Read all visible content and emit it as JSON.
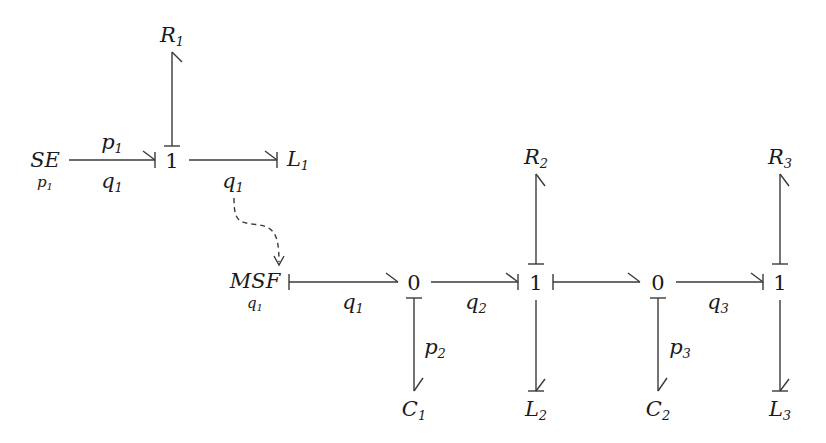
{
  "diagram": {
    "type": "bond-graph",
    "elements": {
      "SE": {
        "base": "SE",
        "sub": "",
        "under": {
          "base": "p",
          "sub": "1"
        }
      },
      "R1": {
        "base": "R",
        "sub": "1"
      },
      "J1a": {
        "base": "1"
      },
      "L1": {
        "base": "L",
        "sub": "1"
      },
      "MSF": {
        "base": "MSF",
        "sub": "",
        "under": {
          "base": "q",
          "sub": "1"
        }
      },
      "J0a": {
        "base": "0"
      },
      "C1": {
        "base": "C",
        "sub": "1"
      },
      "J1b": {
        "base": "1"
      },
      "R2": {
        "base": "R",
        "sub": "2"
      },
      "L2": {
        "base": "L",
        "sub": "2"
      },
      "J0b": {
        "base": "0"
      },
      "C2": {
        "base": "C",
        "sub": "2"
      },
      "J1c": {
        "base": "1"
      },
      "R3": {
        "base": "R",
        "sub": "3"
      },
      "L3": {
        "base": "L",
        "sub": "3"
      }
    },
    "bond_labels": {
      "se_j1_top": {
        "base": "p",
        "sub": "1"
      },
      "se_j1_bot": {
        "base": "q",
        "sub": "1"
      },
      "j1_l1": {
        "base": "q",
        "sub": "1"
      },
      "msf_j0": {
        "base": "q",
        "sub": "1"
      },
      "j0_j1": {
        "base": "q",
        "sub": "2"
      },
      "j0_c1": {
        "base": "p",
        "sub": "2"
      },
      "j0b_c2": {
        "base": "p",
        "sub": "3"
      },
      "j0b_j1c": {
        "base": "q",
        "sub": "3"
      }
    },
    "signal": {
      "from": "j1_l1 (q1)",
      "to": "MSF",
      "style": "dashed"
    }
  }
}
